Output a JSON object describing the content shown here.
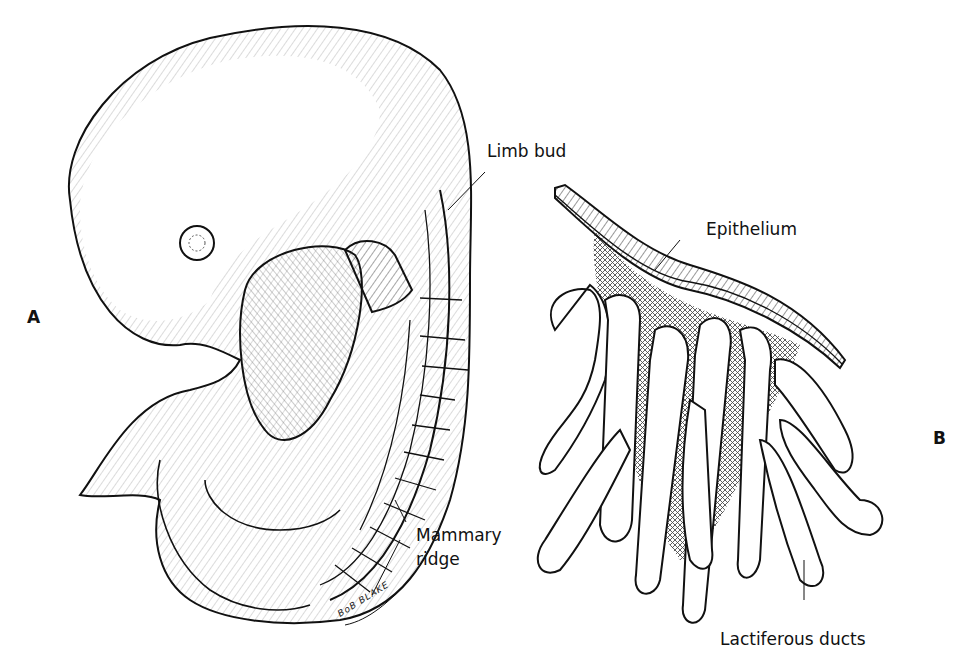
{
  "figure": {
    "panels": [
      {
        "id": "A",
        "letter": "A",
        "description": "Embryo, lateral view, showing mammary ridge",
        "labels": {
          "limb_bud": "Limb bud",
          "mammary_ridge_line1": "Mammary",
          "mammary_ridge_line2": "ridge"
        },
        "signature": "BoB BLAKE"
      },
      {
        "id": "B",
        "letter": "B",
        "description": "Epithelium with budding lactiferous ducts",
        "labels": {
          "epithelium": "Epithelium",
          "lactiferous_ducts": "Lactiferous ducts"
        }
      }
    ],
    "colors": {
      "ink": "#111111",
      "background": "#ffffff",
      "hatch": "#333333"
    }
  }
}
